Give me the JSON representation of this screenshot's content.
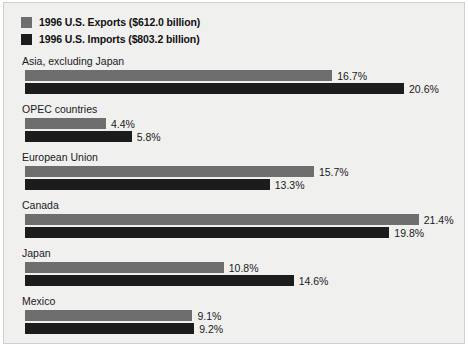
{
  "legend": {
    "items": [
      {
        "label": "1996 U.S. Exports ($612.0 billion)",
        "color": "#6e6e6e",
        "series": "exports"
      },
      {
        "label": "1996 U.S. Imports ($803.2 billion)",
        "color": "#1c1c1c",
        "series": "imports"
      }
    ]
  },
  "chart_data": {
    "type": "bar",
    "orientation": "horizontal",
    "title": "",
    "xlabel": "",
    "ylabel": "",
    "grid": false,
    "legend_position": "top-left",
    "value_suffix": "%",
    "xlim": [
      0,
      22
    ],
    "px_per_unit": 18.4,
    "categories": [
      "Asia, excluding Japan",
      "OPEC countries",
      "European Union",
      "Canada",
      "Japan",
      "Mexico"
    ],
    "series": [
      {
        "name": "1996 U.S. Exports ($612.0 billion)",
        "color": "#6e6e6e",
        "values": [
          16.7,
          4.4,
          15.7,
          21.4,
          10.8,
          9.1
        ],
        "labels": [
          "16.7%",
          "4.4%",
          "15.7%",
          "21.4%",
          "10.8%",
          "9.1%"
        ]
      },
      {
        "name": "1996 U.S. Imports ($803.2 billion)",
        "color": "#1c1c1c",
        "values": [
          20.6,
          5.8,
          13.3,
          19.8,
          14.6,
          9.2
        ],
        "labels": [
          "20.6%",
          "5.8%",
          "13.3%",
          "19.8%",
          "14.6%",
          "9.2%"
        ]
      }
    ]
  }
}
